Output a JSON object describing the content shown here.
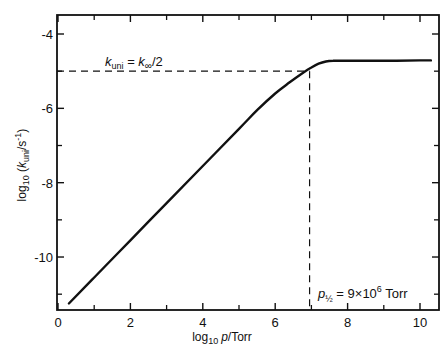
{
  "chart_data": {
    "type": "line",
    "title": "",
    "xlabel": "log10 p / Torr",
    "ylabel": "log10 (k_uni / s^-1)",
    "xlim": [
      0,
      10.5
    ],
    "ylim": [
      -11.5,
      -3.5
    ],
    "grid": false,
    "legend": null,
    "x_ticks": [
      0,
      2,
      4,
      6,
      8,
      10
    ],
    "x_minor_ticks": [
      1,
      3,
      5,
      7,
      9
    ],
    "y_ticks": [
      -4,
      -6,
      -8,
      -10
    ],
    "y_minor_ticks": [
      -5,
      -7,
      -9,
      -11
    ],
    "series": [
      {
        "name": "k_uni",
        "x": [
          0.3,
          1,
          2,
          3,
          4,
          5,
          5.5,
          6,
          6.4,
          6.8,
          7.0,
          7.2,
          7.4,
          7.6,
          8,
          9,
          10,
          10.3
        ],
        "y": [
          -11.25,
          -10.55,
          -9.55,
          -8.55,
          -7.55,
          -6.55,
          -6.05,
          -5.6,
          -5.3,
          -5.02,
          -4.9,
          -4.8,
          -4.74,
          -4.72,
          -4.72,
          -4.72,
          -4.71,
          -4.71
        ]
      }
    ],
    "reference_lines": [
      {
        "type": "horizontal",
        "y": -5.0,
        "x_from": 0,
        "x_to": 6.95,
        "style": "dashed"
      },
      {
        "type": "vertical",
        "x": 6.95,
        "y_from": -5.0,
        "y_to": -11.5,
        "style": "dashed"
      }
    ],
    "annotations": [
      {
        "text_parts": [
          "k",
          "uni",
          " = ",
          "k",
          "∞",
          "/2"
        ],
        "text": "k_uni = k_∞/2",
        "x": 1.3,
        "y": -4.75
      },
      {
        "text_parts": [
          "p",
          "½",
          " = 9×10",
          "6",
          " Torr"
        ],
        "text": "p_½ = 9×10^6 Torr",
        "x": 7.0,
        "y": -10.9
      }
    ]
  },
  "labels": {
    "x_axis": {
      "prefix": "log",
      "sub": "10",
      "var": "p",
      "suffix": "/Torr"
    },
    "y_axis": {
      "prefix": "log",
      "sub": "10",
      "open": " (",
      "var": "k",
      "var_sub": "uni",
      "unit": "/s",
      "unit_sup": "-1",
      "close": ")"
    }
  }
}
